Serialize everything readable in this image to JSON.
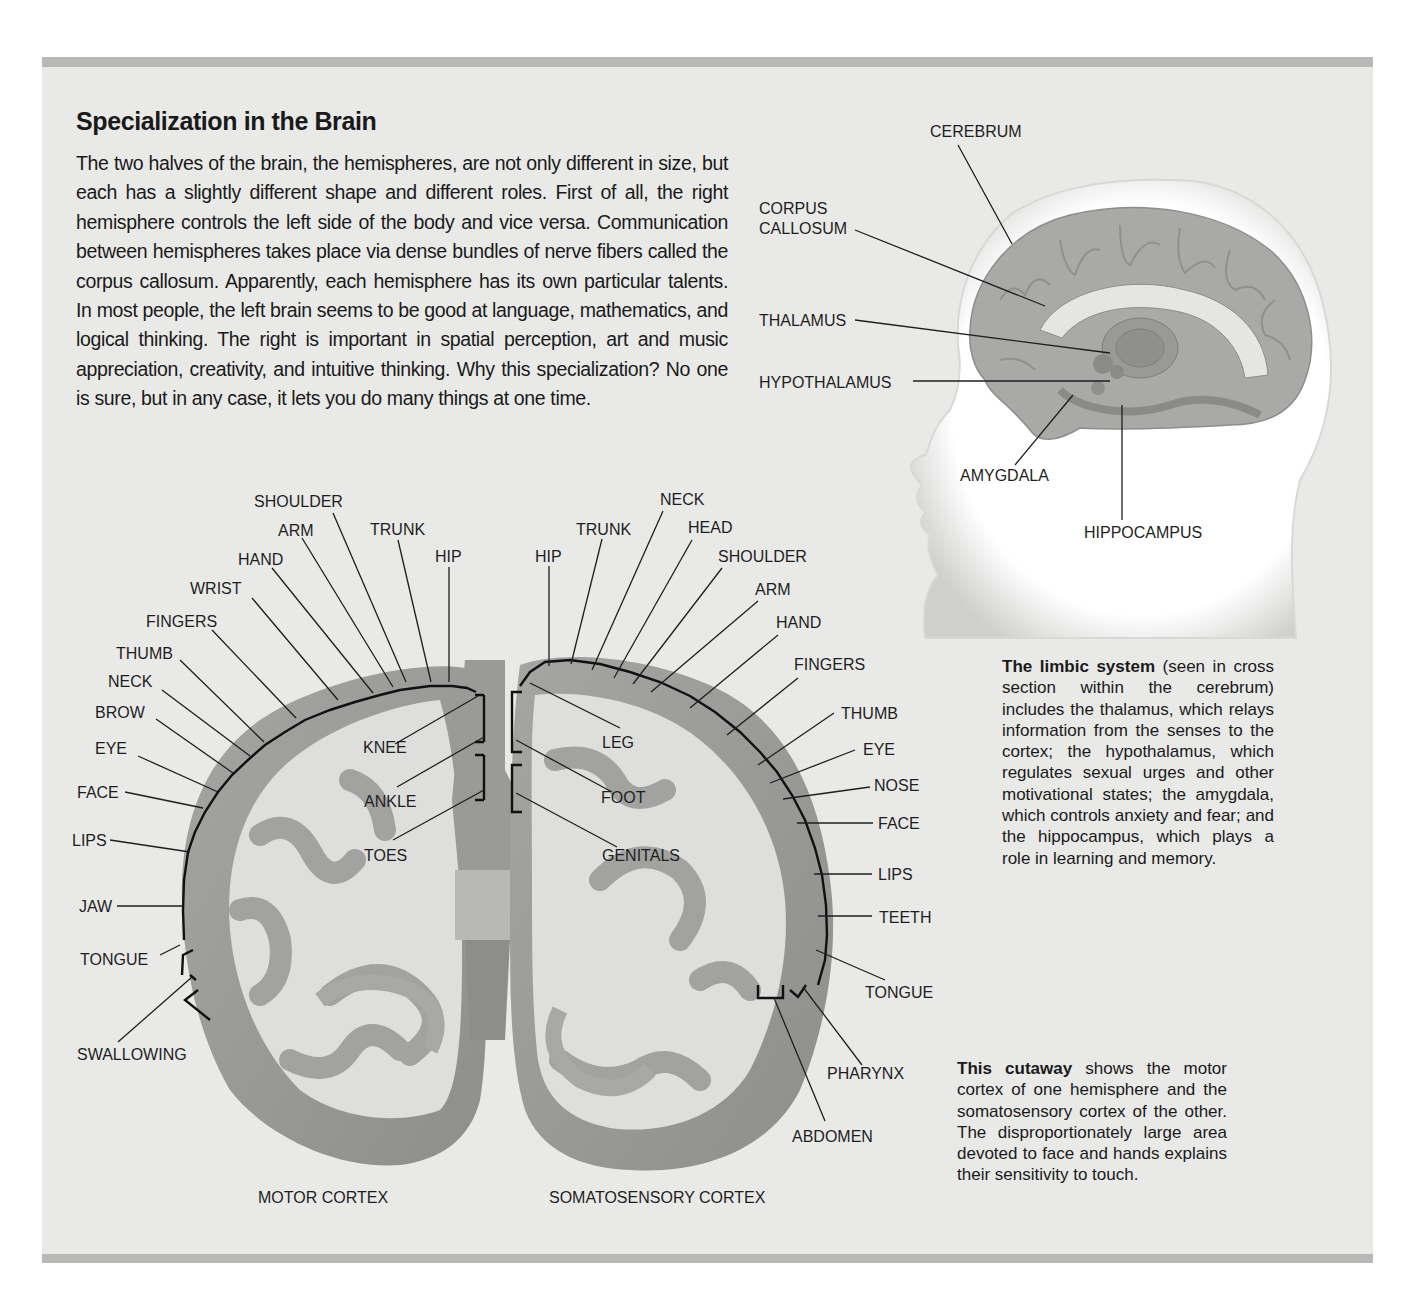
{
  "page": {
    "title": "Specialization in the Brain",
    "intro": "The two halves of the brain, the hemispheres, are not only different in size, but each has a slightly different shape and different roles. First of all, the right hemisphere controls the left side of the body and vice versa. Communication between hemispheres takes place via dense bundles of nerve fibers called the corpus callosum. Apparently, each hemisphere has its own particular talents. In most people, the left brain seems to be good at language, mathematics, and logical thinking. The right is important in spatial perception, art and music appreciation, creativity, and intuitive thinking. Why this specialization? No one is sure, but in any case, it lets you do many things at one time."
  },
  "limbic_figure": {
    "labels": {
      "cerebrum": "CEREBRUM",
      "corpus_1": "CORPUS",
      "corpus_2": "CALLOSUM",
      "thalamus": "THALAMUS",
      "hypothalamus": "HYPOTHALAMUS",
      "amygdala": "AMYGDALA",
      "hippocampus": "HIPPOCAMPUS"
    },
    "caption_lead": "The limbic system",
    "caption_body": " (seen in cross section within the cerebrum) includes the thalamus, which relays information from the senses to the cortex; the hypothalamus, which regulates sexual urges and other motivational states; the amygdala, which controls anxiety and fear; and the hippocampus, which plays a role in learning and memory."
  },
  "cortex_figure": {
    "motor_title": "MOTOR CORTEX",
    "sensory_title": "SOMATOSENSORY CORTEX",
    "motor_labels": {
      "shoulder": "SHOULDER",
      "arm": "ARM",
      "trunk": "TRUNK",
      "hand": "HAND",
      "hip": "HIP",
      "wrist": "WRIST",
      "fingers": "FINGERS",
      "thumb": "THUMB",
      "neck": "NECK",
      "brow": "BROW",
      "eye": "EYE",
      "face": "FACE",
      "lips": "LIPS",
      "jaw": "JAW",
      "tongue": "TONGUE",
      "swallowing": "SWALLOWING",
      "knee": "KNEE",
      "ankle": "ANKLE",
      "toes": "TOES"
    },
    "sensory_labels": {
      "neck": "NECK",
      "trunk": "TRUNK",
      "head": "HEAD",
      "hip": "HIP",
      "shoulder": "SHOULDER",
      "arm": "ARM",
      "hand": "HAND",
      "fingers": "FINGERS",
      "thumb": "THUMB",
      "eye": "EYE",
      "nose": "NOSE",
      "face": "FACE",
      "lips": "LIPS",
      "teeth": "TEETH",
      "tongue": "TONGUE",
      "pharynx": "PHARYNX",
      "abdomen": "ABDOMEN",
      "leg": "LEG",
      "foot": "FOOT",
      "genitals": "GENITALS"
    },
    "caption_lead": "This cutaway",
    "caption_body": " shows the motor cortex of one hemisphere and the somatosensory cortex of the other. The disproportionately large area devoted to face and hands explains their sensitivity to touch."
  },
  "colors": {
    "panel": "#e9e9e7",
    "rule": "#b8b8b6",
    "cortex_gray": "#9c9c9a",
    "white_matter": "#dededc",
    "head_white": "#ffffff"
  }
}
